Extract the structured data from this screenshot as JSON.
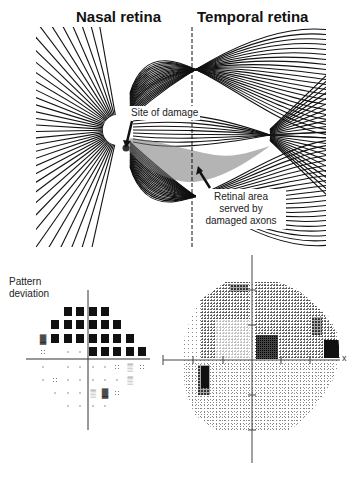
{
  "figure": {
    "top_panel": {
      "headings": {
        "nasal": "Nasal retina",
        "temporal": "Temporal retina"
      },
      "annotations": {
        "site_of_damage": "Site of damage",
        "retinal_area": [
          "Retinal area",
          "served by",
          "damaged axons"
        ]
      }
    },
    "bottom_left_panel": {
      "title_lines": [
        "Pattern",
        "deviation"
      ],
      "grid": {
        "columns_x": [
          43,
          55,
          68,
          80,
          93,
          105,
          117,
          130,
          142
        ],
        "rows": [
          {
            "y": 312,
            "cells": [
              null,
              null,
              null,
              "B",
              "B",
              "B",
              "B",
              null,
              null
            ]
          },
          {
            "y": 325,
            "cells": [
              null,
              null,
              "B",
              "B",
              "B",
              "B",
              "B",
              "B",
              null
            ]
          },
          {
            "y": 339,
            "cells": [
              null,
              "S",
              "B",
              "B",
              "B",
              "B",
              "B",
              "B",
              "B"
            ]
          },
          {
            "y": 352,
            "cells": [
              null,
              "d",
              null,
              ".",
              ".",
              "B",
              "B",
              "B",
              "B",
              "B"
            ]
          },
          {
            "y": 367,
            "cells": [
              null,
              ".",
              null,
              ".",
              ".",
              ".",
              ".",
              "d",
              "s",
              "d"
            ]
          },
          {
            "y": 380,
            "cells": [
              null,
              ".",
              "d",
              ".",
              ".",
              ".",
              ".",
              ".",
              "s",
              null
            ]
          },
          {
            "y": 393,
            "cells": [
              null,
              null,
              ".",
              ".",
              ".",
              "s",
              "S",
              "d",
              null,
              null
            ]
          },
          {
            "y": 406,
            "cells": [
              null,
              null,
              null,
              ".",
              ".",
              ".",
              ".",
              null,
              null,
              null
            ]
          }
        ],
        "legend": {
          "B": "black square (p<0.5%)",
          "S": "dense checker",
          "s": "light checker",
          "d": "dotted",
          ".": "single dot"
        }
      }
    },
    "bottom_right_panel": {
      "axis_end_label": "x"
    }
  }
}
